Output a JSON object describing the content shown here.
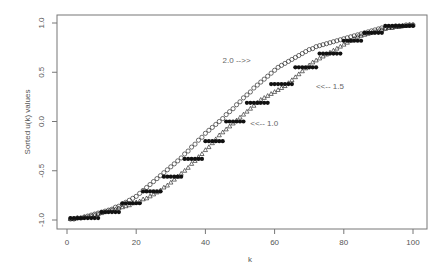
{
  "chart_data": {
    "type": "scatter",
    "title": "",
    "xlabel": "k",
    "ylabel": "Sorted u(k) values",
    "xlim": [
      -4,
      104
    ],
    "ylim": [
      -1.1,
      1.1
    ],
    "xticks": [
      0,
      20,
      40,
      60,
      80,
      100
    ],
    "xtick_labels": [
      "0",
      "20",
      "40",
      "60",
      "80",
      "100"
    ],
    "yticks": [
      -1.0,
      -0.5,
      0.0,
      0.5,
      1.0
    ],
    "ytick_labels": [
      "-1.0",
      "-0.5",
      "0.0",
      "0.5",
      "1.0"
    ],
    "grid": false,
    "legend": null,
    "annotations": [
      {
        "text": "2.0 -->>",
        "x": 49,
        "y": 0.62
      },
      {
        "text": "<<-- 1.5",
        "x": 76,
        "y": 0.36
      },
      {
        "text": "<<-- 1.0",
        "x": 57,
        "y": -0.02
      }
    ],
    "series": [
      {
        "name": "2.0",
        "marker": "open-circle",
        "values": [
          -0.99,
          -0.99,
          -0.98,
          -0.98,
          -0.97,
          -0.96,
          -0.95,
          -0.94,
          -0.93,
          -0.92,
          -0.91,
          -0.9,
          -0.89,
          -0.87,
          -0.86,
          -0.84,
          -0.82,
          -0.8,
          -0.78,
          -0.76,
          -0.73,
          -0.7,
          -0.67,
          -0.64,
          -0.61,
          -0.58,
          -0.55,
          -0.52,
          -0.49,
          -0.46,
          -0.43,
          -0.4,
          -0.37,
          -0.33,
          -0.3,
          -0.26,
          -0.23,
          -0.19,
          -0.16,
          -0.12,
          -0.09,
          -0.06,
          -0.03,
          0.0,
          0.03,
          0.07,
          0.1,
          0.13,
          0.17,
          0.2,
          0.24,
          0.27,
          0.3,
          0.34,
          0.37,
          0.4,
          0.43,
          0.46,
          0.49,
          0.52,
          0.55,
          0.57,
          0.59,
          0.61,
          0.63,
          0.65,
          0.67,
          0.69,
          0.71,
          0.73,
          0.74,
          0.76,
          0.77,
          0.78,
          0.79,
          0.8,
          0.81,
          0.82,
          0.83,
          0.84,
          0.85,
          0.86,
          0.87,
          0.88,
          0.89,
          0.9,
          0.91,
          0.92,
          0.93,
          0.94,
          0.95,
          0.95,
          0.96,
          0.96,
          0.97,
          0.97,
          0.97,
          0.98,
          0.98,
          0.98
        ]
      },
      {
        "name": "1.5",
        "marker": "open-triangle",
        "values": [
          -0.99,
          -0.99,
          -0.98,
          -0.98,
          -0.97,
          -0.97,
          -0.96,
          -0.95,
          -0.94,
          -0.93,
          -0.92,
          -0.91,
          -0.9,
          -0.89,
          -0.88,
          -0.87,
          -0.86,
          -0.85,
          -0.83,
          -0.82,
          -0.81,
          -0.79,
          -0.78,
          -0.76,
          -0.74,
          -0.72,
          -0.7,
          -0.67,
          -0.65,
          -0.62,
          -0.59,
          -0.56,
          -0.53,
          -0.5,
          -0.47,
          -0.43,
          -0.4,
          -0.36,
          -0.33,
          -0.29,
          -0.26,
          -0.22,
          -0.18,
          -0.14,
          -0.11,
          -0.08,
          -0.05,
          -0.02,
          0.01,
          0.04,
          0.07,
          0.1,
          0.13,
          0.16,
          0.19,
          0.22,
          0.24,
          0.26,
          0.28,
          0.3,
          0.32,
          0.34,
          0.36,
          0.39,
          0.42,
          0.45,
          0.48,
          0.51,
          0.54,
          0.57,
          0.6,
          0.62,
          0.64,
          0.66,
          0.68,
          0.7,
          0.72,
          0.74,
          0.76,
          0.78,
          0.8,
          0.82,
          0.84,
          0.86,
          0.87,
          0.88,
          0.89,
          0.9,
          0.91,
          0.92,
          0.93,
          0.94,
          0.95,
          0.95,
          0.96,
          0.96,
          0.97,
          0.97,
          0.98,
          0.98
        ]
      },
      {
        "name": "1.0",
        "marker": "filled-circle",
        "steps": [
          {
            "k_from": 1,
            "k_to": 9,
            "value": -0.98
          },
          {
            "k_from": 10,
            "k_to": 15,
            "value": -0.92
          },
          {
            "k_from": 16,
            "k_to": 21,
            "value": -0.83
          },
          {
            "k_from": 22,
            "k_to": 27,
            "value": -0.71
          },
          {
            "k_from": 28,
            "k_to": 33,
            "value": -0.56
          },
          {
            "k_from": 34,
            "k_to": 39,
            "value": -0.38
          },
          {
            "k_from": 40,
            "k_to": 45,
            "value": -0.2
          },
          {
            "k_from": 46,
            "k_to": 51,
            "value": 0.0
          },
          {
            "k_from": 52,
            "k_to": 58,
            "value": 0.19
          },
          {
            "k_from": 59,
            "k_to": 65,
            "value": 0.38
          },
          {
            "k_from": 66,
            "k_to": 72,
            "value": 0.55
          },
          {
            "k_from": 73,
            "k_to": 79,
            "value": 0.69
          },
          {
            "k_from": 80,
            "k_to": 85,
            "value": 0.82
          },
          {
            "k_from": 86,
            "k_to": 91,
            "value": 0.9
          },
          {
            "k_from": 92,
            "k_to": 100,
            "value": 0.97
          }
        ]
      }
    ]
  },
  "layout": {
    "plot_left": 57,
    "plot_right": 427,
    "plot_top": 15,
    "plot_bottom": 229,
    "x0_px": 67,
    "x100_px": 413,
    "yneg1_px": 220,
    "ypos1_px": 23
  },
  "colors": {
    "axis": "#777777",
    "marker": "#111111",
    "text": "#555555"
  }
}
